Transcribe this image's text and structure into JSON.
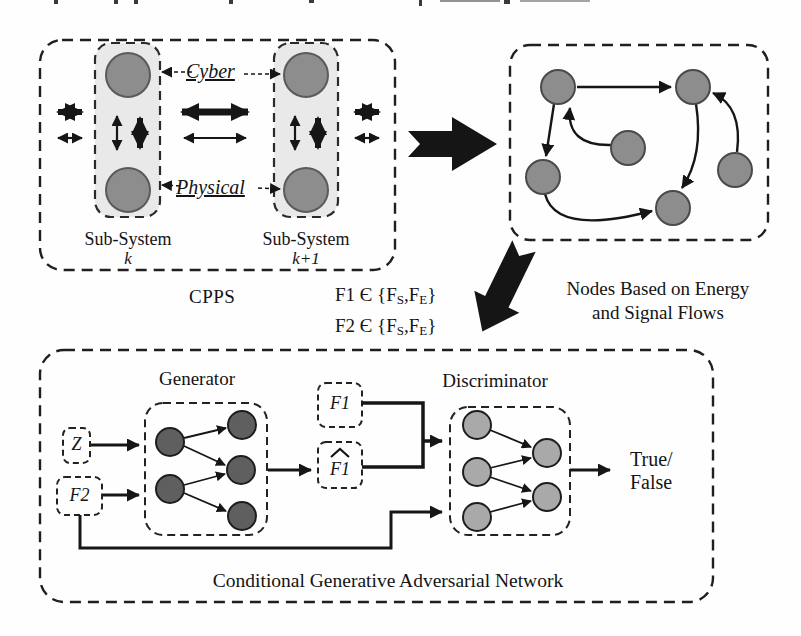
{
  "figure": {
    "cpps": {
      "label": "CPPS",
      "cyber": "Cyber",
      "physical": "Physical",
      "sub_k": {
        "title": "Sub-System",
        "index": "k"
      },
      "sub_k1": {
        "title": "Sub-System",
        "index": "k+1"
      }
    },
    "flow_sets": {
      "f1_prefix": "F1 Є {F",
      "f1_sub1": "S",
      "f1_mid": ",F",
      "f1_sub2": "E",
      "f1_suffix": "}",
      "f2_prefix": "F2 Є {F",
      "f2_sub1": "S",
      "f2_mid": ",F",
      "f2_sub2": "E",
      "f2_suffix": "}"
    },
    "annotation": {
      "line1": "Nodes Based on Energy",
      "line2": "and Signal Flows"
    },
    "gan": {
      "generator": "Generator",
      "discriminator": "Discriminator",
      "z": "Z",
      "f2": "F2",
      "f1": "F1",
      "f1_hat": "F1",
      "result_line1": "True/",
      "result_line2": "False",
      "caption": "Conditional Generative Adversarial Network"
    },
    "colors": {
      "node_gray": "#8d8d8d",
      "node_gray_stroke": "#4f4f4f",
      "generator_node": "#5f5f5f",
      "discriminator_node": "#a9a9a9",
      "subsystem_fill": "#e9e9e9",
      "line": "#161616"
    }
  }
}
